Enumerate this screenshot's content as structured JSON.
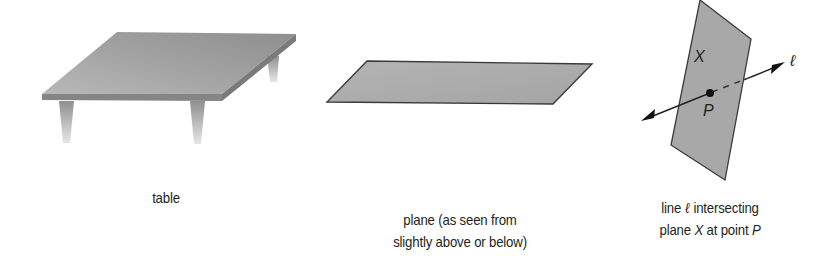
{
  "figures": {
    "table": {
      "caption": "table"
    },
    "plane": {
      "caption_line1": "plane (as seen from",
      "caption_line2": "slightly above or below)"
    },
    "line_plane": {
      "caption_line1_a": "line ",
      "caption_line1_ell": "ℓ",
      "caption_line1_b": " intersecting",
      "caption_line2_a": "plane ",
      "caption_line2_X": "X",
      "caption_line2_b": " at point ",
      "caption_line2_P": "P",
      "label_plane": "X",
      "label_point": "P",
      "label_line": "ℓ"
    }
  },
  "colors": {
    "plane_fill": "#a9a9a9",
    "table_top": "#9d9d9d",
    "outline": "#3a3a3a",
    "text": "#231f20"
  }
}
